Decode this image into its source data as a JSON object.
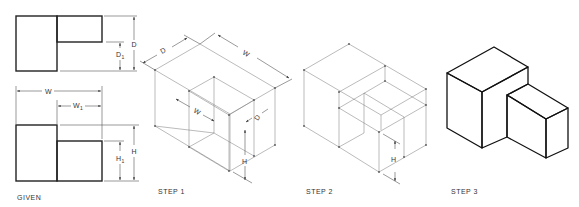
{
  "figure": {
    "panels": [
      {
        "id": "given",
        "label": "GIVEN"
      },
      {
        "id": "step1",
        "label": "STEP 1"
      },
      {
        "id": "step2",
        "label": "STEP 2"
      },
      {
        "id": "step3",
        "label": "STEP 3"
      }
    ]
  },
  "given": {
    "label": "GIVEN",
    "top_view_dims": {
      "depth": "D",
      "depth1": "D",
      "depth1_sub": "1"
    },
    "front_view_dims": {
      "width": "W",
      "width1": "W",
      "width1_sub": "1",
      "height": "H",
      "height1": "H",
      "height1_sub": "1"
    }
  },
  "step1": {
    "label": "STEP 1",
    "dims": {
      "depth": "D",
      "width": "W",
      "width1": "W",
      "width1_sub": "1",
      "depth1": "D",
      "depth1_sub": "1",
      "height1": "H",
      "height1_sub": "1"
    }
  },
  "step2": {
    "label": "STEP 2",
    "dims": {
      "height1": "H",
      "height1_sub": "1"
    }
  },
  "step3": {
    "label": "STEP 3",
    "colors": {
      "shade_dark": "#a8a8a8",
      "shade_light": "#d6d6d6",
      "top": "#ffffff",
      "edge": "#111111"
    }
  }
}
